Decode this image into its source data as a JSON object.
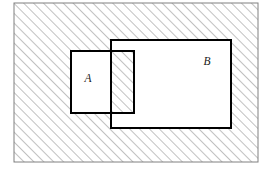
{
  "figure": {
    "name": "set-difference-venn-diagram",
    "width": 267,
    "height": 169,
    "background_color": "#ffffff"
  },
  "universal_set": {
    "name": "universal-set-rectangle",
    "x": 14,
    "y": 3,
    "width": 244,
    "height": 159,
    "stroke_color": "#808080",
    "stroke_width": 1,
    "fill": "hatched",
    "label": ""
  },
  "sets": [
    {
      "id": "A",
      "label": "A",
      "label_x": 88,
      "label_y": 82,
      "x": 71,
      "y": 51,
      "width": 63,
      "height": 62,
      "stroke_color": "#000000",
      "stroke_width": 2,
      "fill": "white"
    },
    {
      "id": "B",
      "label": "B",
      "label_x": 207,
      "label_y": 65,
      "x": 111,
      "y": 40,
      "width": 120,
      "height": 88,
      "stroke_color": "#000000",
      "stroke_width": 2,
      "fill": "white"
    }
  ],
  "intersection": {
    "name": "a-intersect-b-region",
    "x": 111,
    "y": 51,
    "width": 23,
    "height": 62,
    "fill": "hatched"
  },
  "hatching": {
    "angle_degrees": 45,
    "direction": "lower-left-to-upper-right",
    "spacing_px": 7,
    "line_color": "#8c8c8c",
    "line_width": 1.1
  },
  "colors": {
    "hatch": "#8c8c8c",
    "set_outline": "#000000",
    "universe_outline": "#808080",
    "label_text": "#1a1a1a",
    "background": "#ffffff"
  }
}
